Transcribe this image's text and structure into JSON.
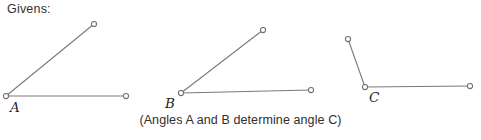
{
  "figure": {
    "givens_label": "Givens:",
    "caption": "(Angles A and B determine angle C)",
    "clipped_footer": "",
    "canvas": {
      "width": 481,
      "height": 140
    },
    "colors": {
      "background": "#ffffff",
      "line": "#7a7a7a",
      "node_stroke": "#6f6f6f",
      "node_fill": "#ffffff",
      "text": "#2b2b2b"
    },
    "angles": [
      {
        "name": "angle-a",
        "label": "A",
        "vertex": {
          "x": 6,
          "y": 96
        },
        "rays": [
          {
            "name": "upper-ray",
            "endpoint": {
              "x": 94,
              "y": 24
            }
          },
          {
            "name": "horizontal-ray",
            "endpoint": {
              "x": 126,
              "y": 96
            }
          }
        ]
      },
      {
        "name": "angle-b",
        "label": "B",
        "vertex": {
          "x": 181,
          "y": 93
        },
        "rays": [
          {
            "name": "upper-ray",
            "endpoint": {
              "x": 263,
              "y": 30
            }
          },
          {
            "name": "horizontal-ray",
            "endpoint": {
              "x": 311,
              "y": 90
            }
          }
        ]
      },
      {
        "name": "angle-c",
        "label": "C",
        "vertex": {
          "x": 365,
          "y": 87
        },
        "rays": [
          {
            "name": "upper-ray",
            "endpoint": {
              "x": 348,
              "y": 39
            }
          },
          {
            "name": "horizontal-ray",
            "endpoint": {
              "x": 470,
              "y": 86
            }
          }
        ]
      }
    ]
  }
}
